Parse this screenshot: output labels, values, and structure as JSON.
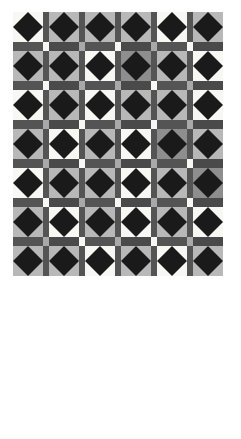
{
  "artwork": {
    "title": "Pinwheel Quilt",
    "type": "quilt-pattern",
    "canvas_width": 241,
    "canvas_height": 439,
    "background_color": "#ffffff"
  },
  "palette": {
    "black": "#1a1a1a",
    "white": "#f7f7f4",
    "gray_mid": "#8e8e8e",
    "gray_light": "#b8b8b8",
    "gray_dark": "#4f4f4f",
    "sashing": "#545454",
    "sashing_alt": "#4a4a4a",
    "node_white": "#f7f7f4",
    "node_light": "#a9a9a9"
  },
  "geometry": {
    "origin_x": 13,
    "origin_y": 12,
    "block_size": 30,
    "v_sash_width": 6,
    "h_sash_height": 9,
    "columns": 6,
    "rows": 7
  },
  "sashing_rows": [
    {
      "index": 0,
      "nodes": [
        "node_white",
        "node_light",
        "node_white",
        "node_light",
        "node_white"
      ],
      "node_labels": [
        "white",
        "light",
        "white",
        "light",
        "white"
      ]
    },
    {
      "index": 1,
      "nodes": [
        "node_white",
        "node_light",
        "node_light",
        "node_white",
        "node_light"
      ],
      "node_labels": [
        "white",
        "light",
        "light",
        "white",
        "light"
      ]
    },
    {
      "index": 2,
      "nodes": [
        "node_light",
        "node_white",
        "node_light",
        "node_white",
        "node_light"
      ],
      "node_labels": [
        "light",
        "white",
        "light",
        "white",
        "light"
      ]
    },
    {
      "index": 3,
      "nodes": [
        "node_light",
        "node_white",
        "node_light",
        "node_light",
        "node_white"
      ],
      "node_labels": [
        "light",
        "white",
        "light",
        "light",
        "white"
      ]
    },
    {
      "index": 4,
      "nodes": [
        "node_white",
        "node_light",
        "node_white",
        "node_light",
        "node_white"
      ],
      "node_labels": [
        "white",
        "light",
        "white",
        "light",
        "white"
      ]
    },
    {
      "index": 5,
      "nodes": [
        "node_light",
        "node_white",
        "node_light",
        "node_white",
        "node_light"
      ],
      "node_labels": [
        "light",
        "white",
        "light",
        "white",
        "light"
      ]
    }
  ],
  "block_rows": [
    {
      "index": 0,
      "blocks": [
        {
          "a": "black",
          "b": "white"
        },
        {
          "a": "black",
          "b": "gray_light"
        },
        {
          "a": "black",
          "b": "gray_light"
        },
        {
          "a": "black",
          "b": "gray_light"
        },
        {
          "a": "black",
          "b": "white"
        },
        {
          "a": "black",
          "b": "gray_light"
        }
      ]
    },
    {
      "index": 1,
      "blocks": [
        {
          "a": "black",
          "b": "gray_light"
        },
        {
          "a": "black",
          "b": "gray_light"
        },
        {
          "a": "black",
          "b": "white"
        },
        {
          "a": "black",
          "b": "gray_mid"
        },
        {
          "a": "black",
          "b": "gray_light"
        },
        {
          "a": "black",
          "b": "white"
        }
      ]
    },
    {
      "index": 2,
      "blocks": [
        {
          "a": "black",
          "b": "white"
        },
        {
          "a": "black",
          "b": "gray_light"
        },
        {
          "a": "black",
          "b": "white"
        },
        {
          "a": "black",
          "b": "gray_light"
        },
        {
          "a": "black",
          "b": "gray_light"
        },
        {
          "a": "black",
          "b": "white"
        }
      ]
    },
    {
      "index": 3,
      "blocks": [
        {
          "a": "black",
          "b": "gray_light"
        },
        {
          "a": "black",
          "b": "white"
        },
        {
          "a": "black",
          "b": "gray_light"
        },
        {
          "a": "black",
          "b": "white"
        },
        {
          "a": "black",
          "b": "gray_mid"
        },
        {
          "a": "black",
          "b": "gray_light"
        }
      ]
    },
    {
      "index": 4,
      "blocks": [
        {
          "a": "black",
          "b": "white"
        },
        {
          "a": "black",
          "b": "gray_light"
        },
        {
          "a": "black",
          "b": "gray_light"
        },
        {
          "a": "black",
          "b": "white"
        },
        {
          "a": "black",
          "b": "gray_light"
        },
        {
          "a": "black",
          "b": "gray_mid"
        }
      ]
    },
    {
      "index": 5,
      "blocks": [
        {
          "a": "black",
          "b": "gray_light"
        },
        {
          "a": "black",
          "b": "white"
        },
        {
          "a": "black",
          "b": "gray_light"
        },
        {
          "a": "black",
          "b": "white"
        },
        {
          "a": "black",
          "b": "gray_light"
        },
        {
          "a": "black",
          "b": "white"
        }
      ]
    },
    {
      "index": 6,
      "blocks": [
        {
          "a": "black",
          "b": "gray_light"
        },
        {
          "a": "black",
          "b": "gray_light"
        },
        {
          "a": "black",
          "b": "white"
        },
        {
          "a": "black",
          "b": "gray_light"
        },
        {
          "a": "black",
          "b": "white"
        },
        {
          "a": "black",
          "b": "gray_light"
        }
      ]
    }
  ]
}
